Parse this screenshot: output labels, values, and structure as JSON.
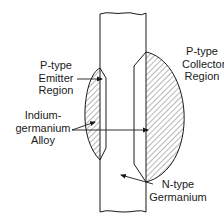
{
  "diagram": {
    "type": "alloy-junction-transistor-cross-section",
    "colors": {
      "stroke": "#1a1a1a",
      "background": "#ffffff",
      "hatch": "#4a4a4a"
    },
    "labels": {
      "emitter": {
        "line1": "P-type",
        "line2": "Emitter",
        "line3": "Region"
      },
      "collector": {
        "line1": "P-type",
        "line2": "Collector",
        "line3": "Region"
      },
      "alloy": {
        "line1": "Indium-",
        "line2": "germanium",
        "line3": "Alloy"
      },
      "base": {
        "line1": "N-type",
        "line2": "Germanium"
      }
    },
    "components": [
      {
        "name": "germanium-bar",
        "description": "N-type Germanium bar"
      },
      {
        "name": "emitter-region",
        "description": "P-type Emitter Region (indium-germanium alloy, hatched)"
      },
      {
        "name": "collector-region",
        "description": "P-type Collector Region (indium-germanium alloy, hatched)"
      }
    ]
  }
}
